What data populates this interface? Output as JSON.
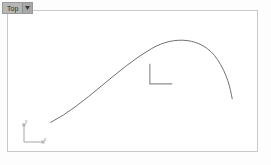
{
  "viewport": {
    "view_label": "Top",
    "dropdown_arrow_icon": "chevron-down-icon",
    "background_color": "#ffffff",
    "border_color": "#c9c9c9",
    "outer_background_color": "#fdfdfd"
  },
  "axis_gizmo": {
    "name": "world-axis-tripod",
    "y_label": "y",
    "x_label": "x",
    "color": "#9a9a9a"
  },
  "scene": {
    "curve": {
      "name": "arc-spline",
      "color": "#6e6e6e",
      "stroke_width": 1,
      "path": "M 43 113 C 78 95, 110 58, 145 38 C 167 25, 196 26, 211 49 C 221 64, 224 78, 226 89"
    },
    "corner_marker": {
      "name": "l-shaped-corner-gizmo",
      "color": "#8e8e8e",
      "stroke_width": 1.2,
      "path": "M 143 54 L 143 74 L 165 74"
    }
  }
}
